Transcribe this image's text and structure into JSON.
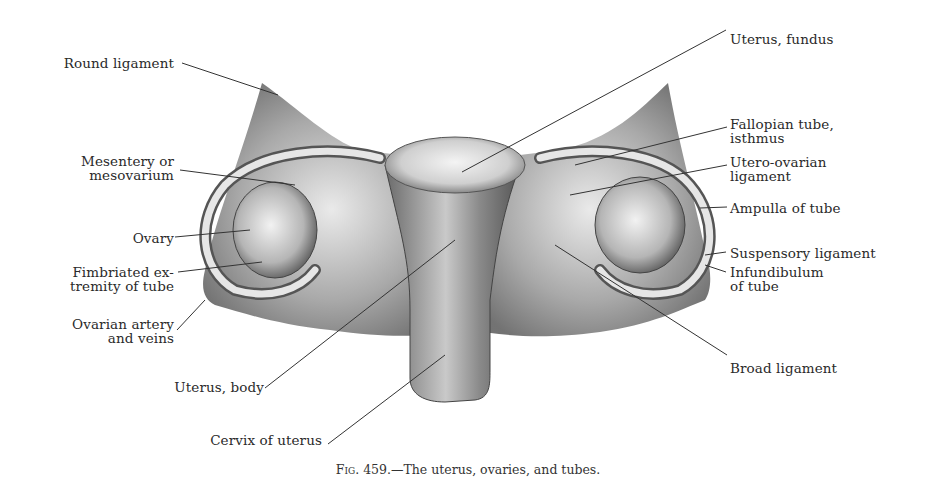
{
  "figure": {
    "caption_prefix": "Fig. 459.",
    "caption_text": "—The uterus, ovaries, and tubes.",
    "labels": {
      "round_ligament": "Round ligament",
      "mesentery_line1": "Mesentery or",
      "mesentery_line2": "mesovarium",
      "ovary": "Ovary",
      "fimbriated_line1": "Fimbriated ex-",
      "fimbriated_line2": "tremity of tube",
      "ovarian_artery_line1": "Ovarian artery",
      "ovarian_artery_line2": "and veins",
      "uterus_body": "Uterus, body",
      "cervix": "Cervix of uterus",
      "uterus_fundus": "Uterus, fundus",
      "fallopian_line1": "Fallopian tube,",
      "fallopian_line2": "isthmus",
      "utero_ovarian_line1": "Utero-ovarian",
      "utero_ovarian_line2": "ligament",
      "ampulla": "Ampulla of tube",
      "suspensory": "Suspensory ligament",
      "infundibulum_line1": "Infundibulum",
      "infundibulum_line2": "of tube",
      "broad_ligament": "Broad ligament"
    }
  }
}
